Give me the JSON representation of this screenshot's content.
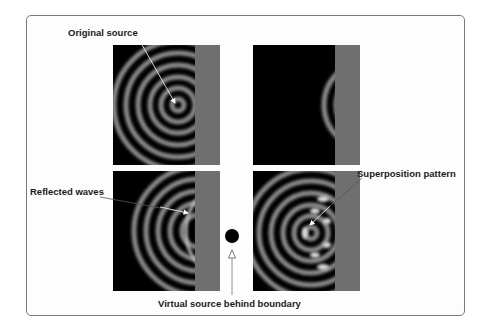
{
  "diagram": {
    "labels": {
      "original_source": "Original source",
      "reflected_waves": "Reflected waves",
      "superposition_pattern": "Superposition pattern",
      "virtual_source": "Virtual source behind boundary"
    },
    "panels": [
      {
        "id": "top-left",
        "content": "Circular waves from original source near boundary"
      },
      {
        "id": "top-right",
        "content": "Wavefronts reaching boundary only"
      },
      {
        "id": "bottom-left",
        "content": "Incident waves with reflected waves"
      },
      {
        "id": "bottom-right",
        "content": "Interference / superposition pattern"
      }
    ],
    "colors": {
      "background": "#ffffff",
      "frame_border": "#7a7a7a",
      "panel_background": "#000000",
      "boundary": "#6f6f6f",
      "wave_ring": "#8a8a8a",
      "virtual_source_dot": "#000000",
      "arrow": "#ffffff"
    }
  }
}
